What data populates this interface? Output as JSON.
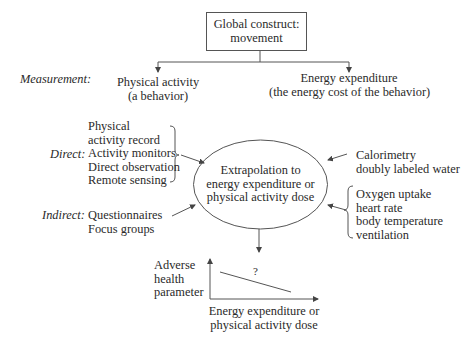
{
  "diagram": {
    "top_box": {
      "line1": "Global construct:",
      "line2": "movement"
    },
    "row_labels": {
      "measurement": "Measurement:",
      "direct": "Direct:",
      "indirect": "Indirect:"
    },
    "measurement_nodes": {
      "physical_activity": {
        "line1": "Physical activity",
        "line2": "(a behavior)"
      },
      "energy_expenditure": {
        "line1": "Energy expenditure",
        "line2": "(the energy cost of the behavior)"
      }
    },
    "direct_left": [
      "Physical",
      "activity record",
      "Activity monitors",
      "Direct observation",
      "Remote sensing"
    ],
    "indirect_left": [
      "Questionnaires",
      "Focus groups"
    ],
    "direct_right": [
      "Calorimetry",
      "doubly labeled water"
    ],
    "indirect_right": [
      "Oxygen uptake",
      "heart rate",
      "body temperature",
      "ventilation"
    ],
    "center_ellipse": {
      "line1": "Extrapolation to",
      "line2": "energy expenditure or",
      "line3": "physical activity dose"
    },
    "mini_chart": {
      "y_label": [
        "Adverse",
        "health",
        "parameter"
      ],
      "x_label": [
        "Energy expenditure or",
        "physical activity dose"
      ],
      "annotation": "?"
    },
    "colors": {
      "line": "#555555",
      "text": "#2a2a2a",
      "background": "#ffffff"
    }
  }
}
